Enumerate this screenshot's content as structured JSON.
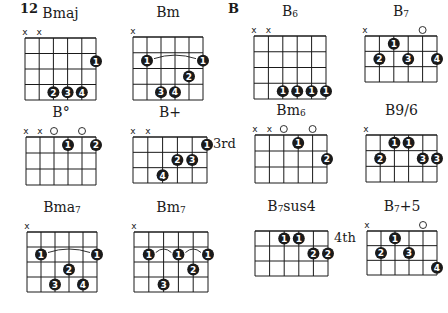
{
  "page": {
    "number": "12",
    "section": "B"
  },
  "colors": {
    "ink": "#1a1a1a",
    "dot_text": "#ffffff",
    "background": "#ffffff"
  },
  "chords": [
    {
      "id": "bmaj",
      "name": "Bmaj",
      "name_main": "Bmaj",
      "name_sub": "",
      "x": 25,
      "y": 38,
      "w": 71,
      "h": 62,
      "frets": 4,
      "position": "",
      "markers": [
        "x",
        "x",
        "",
        "",
        "",
        ""
      ],
      "dots": [
        {
          "s": 6,
          "f": 2,
          "n": "1"
        },
        {
          "s": 3,
          "f": 4,
          "n": "2"
        },
        {
          "s": 4,
          "f": 4,
          "n": "3"
        },
        {
          "s": 5,
          "f": 4,
          "n": "4"
        }
      ],
      "arcs": []
    },
    {
      "id": "bm",
      "name": "Bm",
      "name_main": "Bm",
      "name_sub": "",
      "x": 133,
      "y": 37,
      "w": 70,
      "h": 63,
      "frets": 4,
      "position": "",
      "markers": [
        "x",
        "",
        "",
        "",
        "",
        ""
      ],
      "dots": [
        {
          "s": 2,
          "f": 2,
          "n": "1"
        },
        {
          "s": 6,
          "f": 2,
          "n": "1"
        },
        {
          "s": 5,
          "f": 3,
          "n": "2"
        },
        {
          "s": 3,
          "f": 4,
          "n": "3"
        },
        {
          "s": 4,
          "f": 4,
          "n": "4"
        }
      ],
      "arcs": [
        {
          "from": 2,
          "to": 6,
          "f": 2
        }
      ]
    },
    {
      "id": "b6",
      "name": "B6",
      "name_main": "B",
      "name_sub": "6",
      "x": 254,
      "y": 36,
      "w": 72,
      "h": 63,
      "frets": 4,
      "position": "",
      "markers": [
        "x",
        "x",
        "",
        "",
        "",
        ""
      ],
      "dots": [
        {
          "s": 3,
          "f": 4,
          "n": "1"
        },
        {
          "s": 4,
          "f": 4,
          "n": "1"
        },
        {
          "s": 5,
          "f": 4,
          "n": "1"
        },
        {
          "s": 6,
          "f": 4,
          "n": "1"
        }
      ],
      "arcs": []
    },
    {
      "id": "b7",
      "name": "B7",
      "name_main": "B",
      "name_sub": "7",
      "x": 365,
      "y": 36,
      "w": 72,
      "h": 46,
      "frets": 3,
      "position": "",
      "markers": [
        "x",
        "",
        "",
        "",
        "o",
        ""
      ],
      "dots": [
        {
          "s": 3,
          "f": 1,
          "n": "1"
        },
        {
          "s": 2,
          "f": 2,
          "n": "2"
        },
        {
          "s": 4,
          "f": 2,
          "n": "3"
        },
        {
          "s": 6,
          "f": 2,
          "n": "4"
        }
      ],
      "arcs": []
    },
    {
      "id": "bdim",
      "name": "B°",
      "name_main": "B°",
      "name_sub": "",
      "x": 26,
      "y": 137,
      "w": 70,
      "h": 48,
      "frets": 3,
      "position": "",
      "markers": [
        "x",
        "x",
        "o",
        "",
        "o",
        ""
      ],
      "dots": [
        {
          "s": 4,
          "f": 1,
          "n": "1"
        },
        {
          "s": 6,
          "f": 1,
          "n": "2"
        }
      ],
      "arcs": []
    },
    {
      "id": "baug",
      "name": "B+",
      "name_main": "B+",
      "name_sub": "",
      "x": 133,
      "y": 137,
      "w": 74,
      "h": 46,
      "frets": 3,
      "position": "3rd",
      "markers": [
        "x",
        "x",
        "",
        "",
        "",
        ""
      ],
      "dots": [
        {
          "s": 6,
          "f": 1,
          "n": "1"
        },
        {
          "s": 4,
          "f": 2,
          "n": "2"
        },
        {
          "s": 5,
          "f": 2,
          "n": "3"
        },
        {
          "s": 3,
          "f": 3,
          "n": "4"
        }
      ],
      "arcs": []
    },
    {
      "id": "bm6",
      "name": "Bm6",
      "name_main": "Bm",
      "name_sub": "6",
      "x": 255,
      "y": 135,
      "w": 72,
      "h": 48,
      "frets": 3,
      "position": "",
      "markers": [
        "x",
        "x",
        "o",
        "",
        "o",
        ""
      ],
      "dots": [
        {
          "s": 4,
          "f": 1,
          "n": "1"
        },
        {
          "s": 6,
          "f": 2,
          "n": "2"
        }
      ],
      "arcs": []
    },
    {
      "id": "b96",
      "name": "B9/6",
      "name_main": "B9/6",
      "name_sub": "",
      "x": 366,
      "y": 135,
      "w": 71,
      "h": 47,
      "frets": 3,
      "position": "",
      "markers": [
        "x",
        "",
        "",
        "",
        "",
        ""
      ],
      "dots": [
        {
          "s": 3,
          "f": 1,
          "n": "1"
        },
        {
          "s": 4,
          "f": 1,
          "n": "1"
        },
        {
          "s": 2,
          "f": 2,
          "n": "2"
        },
        {
          "s": 5,
          "f": 2,
          "n": "3"
        },
        {
          "s": 6,
          "f": 2,
          "n": "3"
        }
      ],
      "arcs": []
    },
    {
      "id": "bma7",
      "name": "Bma7",
      "name_main": "Bma",
      "name_sub": "7",
      "x": 27,
      "y": 232,
      "w": 70,
      "h": 60,
      "frets": 4,
      "position": "",
      "markers": [
        "x",
        "",
        "",
        "",
        "",
        ""
      ],
      "dots": [
        {
          "s": 2,
          "f": 2,
          "n": "1"
        },
        {
          "s": 6,
          "f": 2,
          "n": "1"
        },
        {
          "s": 4,
          "f": 3,
          "n": "2"
        },
        {
          "s": 3,
          "f": 4,
          "n": "3"
        },
        {
          "s": 5,
          "f": 4,
          "n": "4"
        }
      ],
      "arcs": [
        {
          "from": 2,
          "to": 6,
          "f": 2
        }
      ]
    },
    {
      "id": "bm7",
      "name": "Bm7",
      "name_main": "Bm",
      "name_sub": "7",
      "x": 134,
      "y": 232,
      "w": 74,
      "h": 60,
      "frets": 4,
      "position": "",
      "markers": [
        "x",
        "",
        "",
        "",
        "",
        ""
      ],
      "dots": [
        {
          "s": 2,
          "f": 2,
          "n": "1"
        },
        {
          "s": 4,
          "f": 2,
          "n": "1"
        },
        {
          "s": 6,
          "f": 2,
          "n": "1"
        },
        {
          "s": 5,
          "f": 3,
          "n": "2"
        },
        {
          "s": 3,
          "f": 4,
          "n": "3"
        }
      ],
      "arcs": [
        {
          "from": 2,
          "to": 4,
          "f": 2
        },
        {
          "from": 4,
          "to": 6,
          "f": 2
        }
      ]
    },
    {
      "id": "b7sus4",
      "name": "B7sus4",
      "name_main": "B",
      "name_sub": "7",
      "name_tail": "sus4",
      "x": 255,
      "y": 231,
      "w": 73,
      "h": 45,
      "frets": 3,
      "position": "4th",
      "markers": [
        "",
        "",
        "",
        "",
        "",
        ""
      ],
      "dots": [
        {
          "s": 3,
          "f": 1,
          "n": "1"
        },
        {
          "s": 4,
          "f": 1,
          "n": "1"
        },
        {
          "s": 5,
          "f": 2,
          "n": "2"
        },
        {
          "s": 6,
          "f": 2,
          "n": "2"
        }
      ],
      "arcs": []
    },
    {
      "id": "b7aug5",
      "name": "B7+5",
      "name_main": "B",
      "name_sub": "7",
      "name_tail": "+5",
      "x": 367,
      "y": 231,
      "w": 70,
      "h": 44,
      "frets": 3,
      "position": "",
      "markers": [
        "x",
        "",
        "",
        "",
        "o",
        ""
      ],
      "dots": [
        {
          "s": 3,
          "f": 1,
          "n": "1"
        },
        {
          "s": 2,
          "f": 2,
          "n": "2"
        },
        {
          "s": 4,
          "f": 2,
          "n": "3"
        },
        {
          "s": 6,
          "f": 3,
          "n": "4"
        }
      ],
      "arcs": []
    }
  ]
}
